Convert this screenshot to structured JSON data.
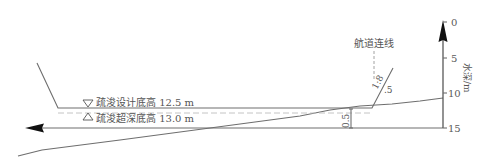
{
  "diagram": {
    "labels": {
      "design_bottom": "疏浚设计底高 12.5 m",
      "over_depth_bottom": "疏浚超深底高 13.0 m",
      "channel_line": "航道连线",
      "slope_ratio": "1:8",
      "slope_ratio_suffix": ".5",
      "over_depth_dimension": "0.5",
      "axis_title": "水深/m"
    },
    "axis": {
      "orientation": "vertical",
      "position": "right",
      "ticks": [
        "0",
        "5",
        "10",
        "15"
      ],
      "tick_values": [
        0,
        5,
        10,
        15
      ],
      "unit": "m",
      "direction": "depth increases downward"
    },
    "symbols": {
      "design_marker": "down-triangle",
      "over_depth_marker": "up-triangle"
    },
    "elevations": {
      "design_bottom_m": 12.5,
      "over_depth_bottom_m": 13.0,
      "over_depth_m": 0.5,
      "side_slope": "1:8.5"
    },
    "colors": {
      "line": "#6e6e6e",
      "text": "#555555",
      "arrow": "#111111",
      "background": "#ffffff"
    }
  }
}
